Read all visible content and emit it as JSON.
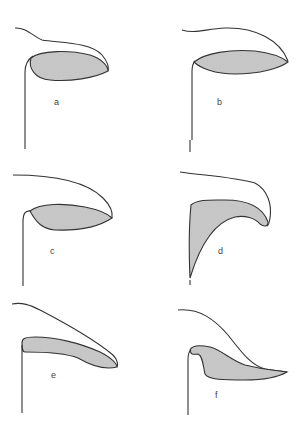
{
  "figure": {
    "panels": [
      {
        "id": "a",
        "label": "a"
      },
      {
        "id": "b",
        "label": "b"
      },
      {
        "id": "c",
        "label": "c"
      },
      {
        "id": "d",
        "label": "d"
      },
      {
        "id": "e",
        "label": "e"
      },
      {
        "id": "f",
        "label": "f"
      }
    ]
  },
  "colors": {
    "stroke": "#333333",
    "fill": "#bdbdbd",
    "background": "#ffffff"
  }
}
